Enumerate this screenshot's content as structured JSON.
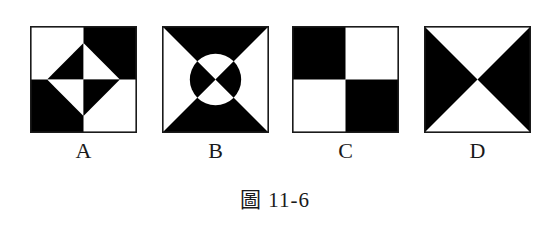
{
  "figures": [
    {
      "id": "A",
      "label": "A",
      "description": "Square divided into quadrants; top-right and bottom-left black; central rotated diamond split into four triangles with alternating colors"
    },
    {
      "id": "B",
      "label": "B",
      "description": "Square with top and bottom triangles black, left and right triangles white; central circle divided by diagonals with left/right segments black and top/bottom segments white"
    },
    {
      "id": "C",
      "label": "C",
      "description": "Square divided into four quadrants; top-left and bottom-right black"
    },
    {
      "id": "D",
      "label": "D",
      "description": "Square divided by diagonals; left and right triangles black, top and bottom triangles white"
    }
  ],
  "caption": "圖 11-6",
  "colors": {
    "fill": "#000000",
    "background": "#ffffff",
    "stroke": "#1a1a1a"
  }
}
